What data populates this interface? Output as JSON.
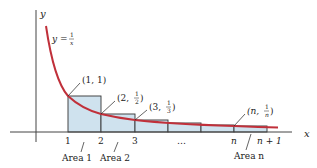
{
  "diagram": {
    "axes": {
      "x_label": "x",
      "y_label": "y"
    },
    "curve_label": {
      "lhs": "y =",
      "num": "1",
      "den": "x"
    },
    "points": [
      {
        "label_pre": "(1, ",
        "num": "",
        "den": "",
        "plain": "(1, 1)"
      },
      {
        "label_pre": "(2, ",
        "num": "1",
        "den": "2",
        "close": ")"
      },
      {
        "label_pre": "(3, ",
        "num": "1",
        "den": "3",
        "close": ")"
      },
      {
        "label_pre": "(n, ",
        "num": "1",
        "den": "n",
        "close": ")"
      }
    ],
    "ticks": [
      "1",
      "2",
      "3",
      "…",
      "n",
      "n + 1"
    ],
    "areas": [
      "Area 1",
      "Area 2",
      "Area n"
    ],
    "colors": {
      "curve": "#c0303a",
      "fill": "#cfe2ee",
      "rect": "#333333",
      "axis": "#444444"
    }
  }
}
